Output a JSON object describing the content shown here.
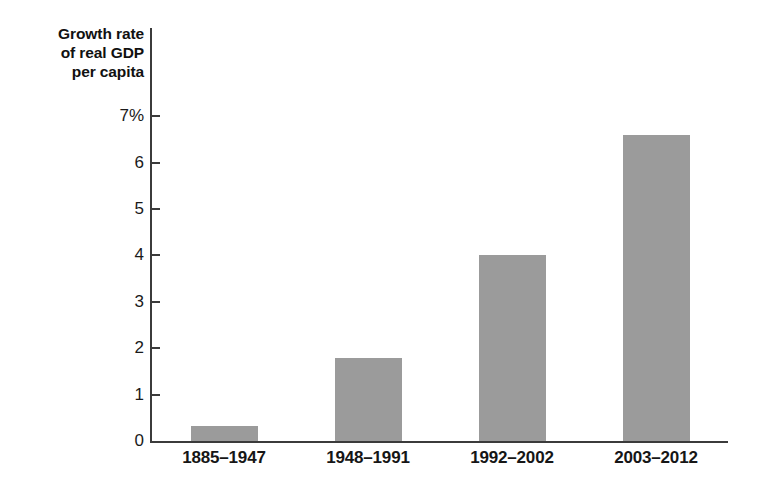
{
  "chart_data": {
    "type": "bar",
    "title": "Growth rate of real GDP per capita",
    "title_lines": [
      "Growth rate",
      "of real GDP",
      "per capita"
    ],
    "categories": [
      "1885–1947",
      "1948–1991",
      "1992–2002",
      "2003–2012"
    ],
    "values": [
      0.32,
      1.78,
      4.0,
      6.6
    ],
    "xlabel": "",
    "ylabel": "Growth rate of real GDP per capita",
    "ylim": [
      0,
      7
    ],
    "ytick_labels": [
      "7%",
      "6",
      "5",
      "4",
      "3",
      "2",
      "1",
      "0"
    ],
    "ytick_values": [
      7,
      6,
      5,
      4,
      3,
      2,
      1,
      0
    ],
    "grid": false,
    "legend": null,
    "bar_color": "#9b9b9b",
    "axis_color": "#3b3b3b",
    "background_color": "#ffffff"
  }
}
